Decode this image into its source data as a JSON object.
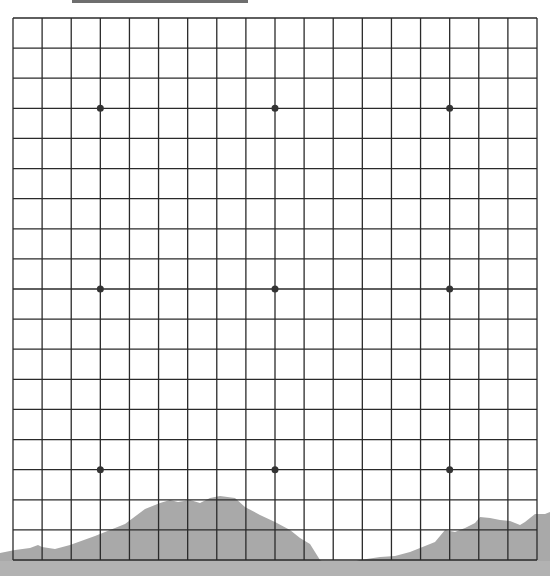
{
  "game": {
    "type": "Go",
    "board_size": 19,
    "stones": [],
    "star_points": [
      {
        "col": 3,
        "row": 3
      },
      {
        "col": 9,
        "row": 3
      },
      {
        "col": 15,
        "row": 3
      },
      {
        "col": 3,
        "row": 9
      },
      {
        "col": 9,
        "row": 9
      },
      {
        "col": 15,
        "row": 9
      },
      {
        "col": 3,
        "row": 15
      },
      {
        "col": 9,
        "row": 15
      },
      {
        "col": 15,
        "row": 15
      }
    ]
  },
  "colors": {
    "grid_line": "#2a2a2a",
    "star_point": "#333333",
    "board_bg": "#ffffff",
    "mountain": "#a9a9a9",
    "ground": "#b4b4b4"
  }
}
